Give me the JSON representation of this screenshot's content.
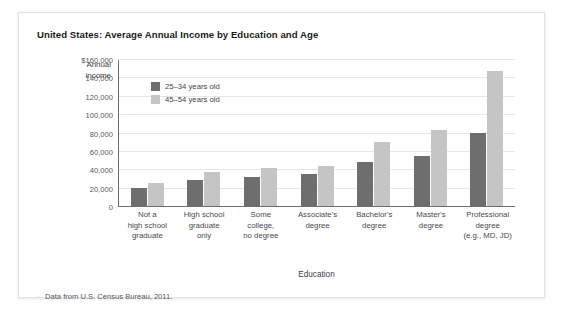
{
  "figure": {
    "title": "United States: Average Annual Income by Education and Age",
    "footnote": "Data from U.S. Census Bureau, 2011.",
    "footnote_bullet": "·"
  },
  "colors": {
    "series_25_34": "#6e6e6e",
    "series_45_54": "#c5c5c5",
    "gridline": "#e6e6e6",
    "axis": "#6d6d6d",
    "text": "#4a4a4c",
    "card_background": "#ffffff",
    "card_border": "#e3e3e3"
  },
  "axis_titles": {
    "y_line1": "Annual",
    "y_line2": "income",
    "x": "Education"
  },
  "legend": {
    "items": [
      {
        "label": "25–34 years old",
        "color": "#6e6e6e"
      },
      {
        "label": "45–54 years old",
        "color": "#c5c5c5"
      }
    ]
  },
  "y_ticks": [
    {
      "label": "$160,000",
      "value": 160000
    },
    {
      "label": "140,000",
      "value": 140000
    },
    {
      "label": "120,000",
      "value": 120000
    },
    {
      "label": "100,000",
      "value": 100000
    },
    {
      "label": "80,000",
      "value": 80000
    },
    {
      "label": "60,000",
      "value": 60000
    },
    {
      "label": "40,000",
      "value": 40000
    },
    {
      "label": "20,000",
      "value": 20000
    },
    {
      "label": "0",
      "value": 0
    }
  ],
  "category_label_lines": [
    [
      "Not a",
      "high school",
      "graduate"
    ],
    [
      "High school",
      "graduate",
      "only"
    ],
    [
      "Some",
      "college,",
      "no degree"
    ],
    [
      "Associate's",
      "degree"
    ],
    [
      "Bachelor's",
      "degree"
    ],
    [
      "Master's",
      "degree"
    ],
    [
      "Professional",
      "degree",
      "(e.g., MD, JD)"
    ]
  ],
  "chart_data": {
    "type": "bar",
    "title": "United States: Average Annual Income by Education and Age",
    "xlabel": "Education",
    "ylabel": "Annual income",
    "ylim": [
      0,
      160000
    ],
    "ytick_interval": 20000,
    "grid": true,
    "legend_position": "upper-left-inside",
    "categories": [
      "Not a high school graduate",
      "High school graduate only",
      "Some college, no degree",
      "Associate's degree",
      "Bachelor's degree",
      "Master's degree",
      "Professional degree (e.g., MD, JD)"
    ],
    "series": [
      {
        "name": "25–34 years old",
        "color": "#6e6e6e",
        "values": [
          20000,
          28000,
          32000,
          35000,
          48000,
          55000,
          80000
        ]
      },
      {
        "name": "45–54 years old",
        "color": "#c5c5c5",
        "values": [
          25000,
          37000,
          42000,
          44000,
          70000,
          83000,
          148000
        ]
      }
    ],
    "annotations": [
      "Data from U.S. Census Bureau, 2011."
    ]
  }
}
